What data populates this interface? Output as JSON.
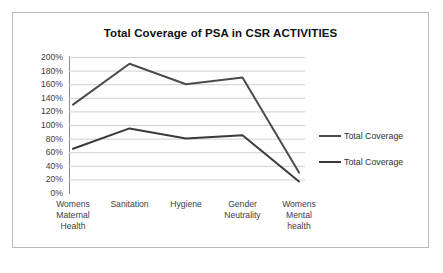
{
  "chart_data": {
    "type": "line",
    "title": "Total Coverage of PSA in CSR ACTIVITIES",
    "xlabel": "",
    "ylabel": "",
    "ylim": [
      0,
      200
    ],
    "ytick_step": 20,
    "ytick_labels": [
      "200%",
      "180%",
      "160%",
      "140%",
      "120%",
      "100%",
      "80%",
      "60%",
      "40%",
      "20%",
      "0%"
    ],
    "ytick_values": [
      200,
      180,
      160,
      140,
      120,
      100,
      80,
      60,
      40,
      20,
      0
    ],
    "grid": true,
    "grid_color": "#cfcfcf",
    "legend_position": "right",
    "categories": [
      "Womens Maternal Health",
      "Sanitation",
      "Hygiene",
      "Gender Neutrality",
      "Womens Mental health"
    ],
    "category_label_lines": [
      [
        "Womens",
        "Maternal",
        "Health"
      ],
      [
        "Sanitation"
      ],
      [
        "Hygiene"
      ],
      [
        "Gender",
        "Neutrality"
      ],
      [
        "Womens",
        "Mental",
        "health"
      ]
    ],
    "series": [
      {
        "name": "Total Coverage",
        "color": "#4b4b4b",
        "values": [
          130,
          190,
          160,
          170,
          30
        ]
      },
      {
        "name": "Total Coverage",
        "color": "#3a3a3a",
        "values": [
          65,
          95,
          80,
          85,
          17
        ]
      }
    ]
  },
  "legend": {
    "entries": [
      {
        "label": "Total Coverage"
      },
      {
        "label": "Total Coverage"
      }
    ]
  },
  "colors": {
    "frame_border": "#b9b9b9",
    "axis": "#8a8a8a",
    "grid": "#cfcfcf",
    "series_1": "#4b4b4b",
    "series_2": "#3a3a3a",
    "title_text": "#111111",
    "tick_text": "#3d3d3d"
  }
}
